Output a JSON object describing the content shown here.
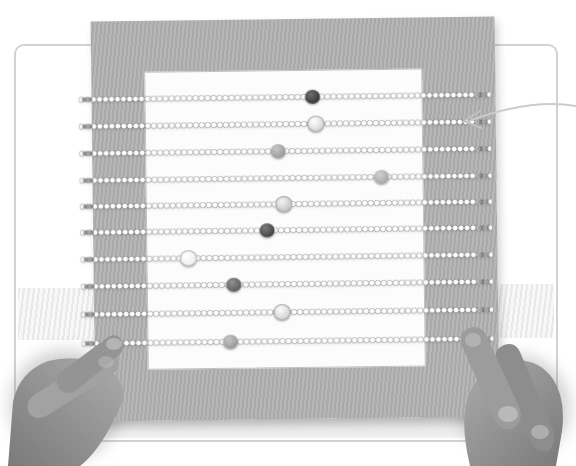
{
  "scene": {
    "type": "black-and-white photograph",
    "description": "Two child hands hold up a square corrugated-cardboard abacus craft: ten beaded pipe-cleaner rods threaded across the board over a white paper square, each rod strung with small pale beads plus one larger accent bead; a thin callout arrow points from the right page edge to the right end of the second rod.",
    "background_color": "#ffffff",
    "palette": {
      "card_border": "#d2d2d2",
      "board_base": "#b7b7b7",
      "board_stripe": "#a9a9a9",
      "paper": "#fcfcfc",
      "paper_edge": "#c3c3c3",
      "rod_beads": "#f0f0f0",
      "rod_tip": "#555555",
      "shadow_band": "#d9d9d9",
      "hand_base": "#9c9c9c",
      "hand_shade": "#7a7a7a",
      "hand_light": "#cccccc",
      "arrow": "#cbcbcb"
    }
  },
  "board": {
    "rod_count": 10,
    "rod_span_x": [
      80,
      492
    ],
    "rows": [
      {
        "row": 1,
        "rod_y": 97,
        "accent_bead": {
          "x": 314,
          "tone": "very-dark",
          "hex": "#3a3a3a",
          "highlight": "#6f6f6f",
          "pale": false
        }
      },
      {
        "row": 2,
        "rod_y": 124,
        "accent_bead": {
          "x": 317,
          "tone": "pale",
          "hex": "#dadada",
          "highlight": "#ffffff",
          "pale": true
        }
      },
      {
        "row": 3,
        "rod_y": 151,
        "accent_bead": {
          "x": 279,
          "tone": "mid-gray",
          "hex": "#9d9d9d",
          "highlight": "#c6c6c6",
          "pale": false
        }
      },
      {
        "row": 4,
        "rod_y": 178,
        "accent_bead": {
          "x": 382,
          "tone": "mid-gray",
          "hex": "#a9a9a9",
          "highlight": "#d2d2d2",
          "pale": false
        }
      },
      {
        "row": 5,
        "rod_y": 204,
        "accent_bead": {
          "x": 284,
          "tone": "light",
          "hex": "#c9c9c9",
          "highlight": "#f4f4f4",
          "pale": true
        }
      },
      {
        "row": 6,
        "rod_y": 230,
        "accent_bead": {
          "x": 267,
          "tone": "dark",
          "hex": "#474747",
          "highlight": "#7a7a7a",
          "pale": false
        }
      },
      {
        "row": 7,
        "rod_y": 257,
        "accent_bead": {
          "x": 188,
          "tone": "white",
          "hex": "#efefef",
          "highlight": "#ffffff",
          "pale": true
        }
      },
      {
        "row": 8,
        "rod_y": 284,
        "accent_bead": {
          "x": 233,
          "tone": "dark",
          "hex": "#616161",
          "highlight": "#909090",
          "pale": false
        }
      },
      {
        "row": 9,
        "rod_y": 312,
        "accent_bead": {
          "x": 281,
          "tone": "pale",
          "hex": "#d7d7d7",
          "highlight": "#fbfbfb",
          "pale": true
        }
      },
      {
        "row": 10,
        "rod_y": 341,
        "accent_bead": {
          "x": 229,
          "tone": "mid-gray",
          "hex": "#9b9b9b",
          "highlight": "#c4c4c4",
          "pale": false
        }
      }
    ]
  },
  "annotation": {
    "arrow": {
      "points_to": "rod-2-right-end",
      "from": "right-page-edge",
      "color": "#cbcbcb"
    }
  },
  "hands": {
    "left": "child hand gripping lower-left edge of the board, thumb and finger over the rod ends",
    "right": "child hand gripping lower-right edge of the board, thumb and finger over the rod ends"
  }
}
